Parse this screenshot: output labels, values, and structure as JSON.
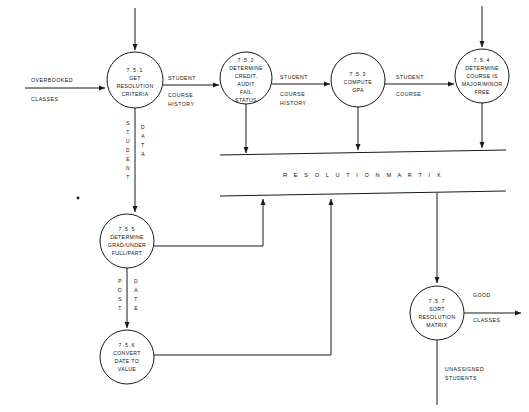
{
  "diagram": {
    "type": "data-flow-diagram",
    "line_color": "#1a1a1a",
    "background": "#ffffff",
    "processes": [
      {
        "id": "7.5.1",
        "name": "GET RESOLUTION CRITERIA",
        "lines": [
          "7.5.1",
          "GET",
          "RESOLUTION",
          "CRITERIA"
        ],
        "cx": 135,
        "cy": 80,
        "r": 28
      },
      {
        "id": "7.5.2",
        "name": "DETERMINE CREDIT, AUDIT FAIL STATUS",
        "lines": [
          "7.5.2",
          "DETERMINE",
          "CREDIT,",
          "AUDIT",
          "FAIL",
          "STATUS"
        ],
        "cx": 246,
        "cy": 78,
        "r": 26
      },
      {
        "id": "7.5.3",
        "name": "COMPUTE GPA",
        "lines": [
          "7.5.3",
          "COMPUTE",
          "GPA"
        ],
        "cx": 358,
        "cy": 80,
        "r": 27
      },
      {
        "id": "7.5.4",
        "name": "DETERMINE COURSE IS MAJOR/MINOR FREE",
        "lines": [
          "7.5.4",
          "DETERMINE",
          "COURSE IS",
          "MAJOR/MINOR",
          "FREE"
        ],
        "cx": 482,
        "cy": 76,
        "r": 27
      },
      {
        "id": "7.5.5",
        "name": "DETERMINE GRAD/UNDER FULL/PART",
        "lines": [
          "7.5.5",
          "DETERMINE",
          "GRAD/UNDER",
          "FULL/PART"
        ],
        "cx": 127,
        "cy": 241,
        "r": 27
      },
      {
        "id": "7.5.6",
        "name": "CONVERT DATE TO VALUE",
        "lines": [
          "7.5.6",
          "CONVERT",
          "DATE TO",
          "VALUE"
        ],
        "cx": 127,
        "cy": 357,
        "r": 27
      },
      {
        "id": "7.5.7",
        "name": "SORT RESOLUTION MATRIX",
        "lines": [
          "7.5.7",
          "SORT",
          "RESOLUTION",
          "MATRIX"
        ],
        "cx": 437,
        "cy": 313,
        "r": 27
      }
    ],
    "data_store": {
      "label": "R E S O L U T I O N   M A R T I X",
      "plain_label": "RESOLUTION MARTIX",
      "x1": 220,
      "x2": 506,
      "y_top": 154,
      "y_bottom": 194
    },
    "flows": [
      {
        "name": "overbooked-classes",
        "label_lines": [
          "OVERBOOKED",
          "CLASSES"
        ],
        "from": "external",
        "to": "7.5.1"
      },
      {
        "name": "student-course-history-1",
        "label_lines": [
          "STUDENT",
          "COURSE HISTORY"
        ],
        "from": "7.5.1",
        "to": "7.5.2"
      },
      {
        "name": "student-course-history-2",
        "label_lines": [
          "STUDENT",
          "COURSE HISTORY"
        ],
        "from": "7.5.2",
        "to": "7.5.3"
      },
      {
        "name": "student-course",
        "label_lines": [
          "STUDENT",
          "COURSE"
        ],
        "from": "7.5.3",
        "to": "7.5.4"
      },
      {
        "name": "student-data",
        "label_lines": [
          "STUDENT",
          "DATA"
        ],
        "orientation": "vertical",
        "from": "7.5.1",
        "to": "7.5.5"
      },
      {
        "name": "post-date",
        "label_lines": [
          "POST",
          "DATE"
        ],
        "orientation": "vertical",
        "from": "7.5.5",
        "to": "7.5.6"
      },
      {
        "name": "good-classes",
        "label_lines": [
          "GOOD",
          "CLASSES"
        ],
        "from": "7.5.7",
        "to": "external"
      },
      {
        "name": "unassigned-students",
        "label_lines": [
          "UNASSIGNED",
          "STUDENTS"
        ],
        "from": "7.5.7",
        "to": "external"
      }
    ],
    "flow_text": {
      "overbooked": "OVERBOOKED",
      "classes": "CLASSES",
      "student": "STUDENT",
      "course_history": "COURSE",
      "history": "HISTORY",
      "course": "COURSE",
      "good": "GOOD",
      "good_classes": "CLASSES",
      "unassigned": "UNASSIGNED",
      "students": "STUDENTS"
    },
    "vertical_text": {
      "student": [
        "S",
        "T",
        "U",
        "D",
        "E",
        "N",
        "T"
      ],
      "data": [
        "D",
        "A",
        "T",
        "A"
      ],
      "post": [
        "P",
        "O",
        "S",
        "T"
      ],
      "date": [
        "D",
        "A",
        "T",
        "E"
      ]
    }
  }
}
